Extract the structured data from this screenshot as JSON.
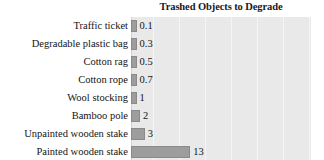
{
  "chart_data": {
    "type": "bar",
    "orientation": "horizontal",
    "title": "Trashed Objects to Degrade",
    "xlabel": "",
    "ylabel": "",
    "grid": true,
    "legend": false,
    "xlim": [
      0,
      40
    ],
    "gridline_step": 5,
    "categories": [
      "Traffic ticket",
      "Degradable plastic bag",
      "Cotton rag",
      "Cotton rope",
      "Wool stocking",
      "Bamboo pole",
      "Unpainted wooden stake",
      "Painted wooden stake"
    ],
    "values": [
      0.1,
      0.3,
      0.5,
      0.7,
      1,
      2,
      3,
      13
    ],
    "value_labels": [
      "0.1",
      "0.3",
      "0.5",
      "0.7",
      "1",
      "2",
      "3",
      "13"
    ],
    "colors": {
      "bar_fill": "#9d9d9d",
      "bar_stroke": "#8a8a8a",
      "plot_background": "#e9e9e9",
      "gridline": "#f5f5f5",
      "page_background": "#ffffff",
      "text": "#141414"
    }
  }
}
